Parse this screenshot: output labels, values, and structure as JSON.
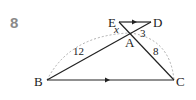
{
  "problem_number": "8",
  "points": {
    "E": {
      "label": "E",
      "x": 119,
      "y": 22
    },
    "D": {
      "label": "D",
      "x": 151,
      "y": 22
    },
    "A": {
      "label": "A",
      "x": 130,
      "y": 33
    },
    "B": {
      "label": "B",
      "x": 47,
      "y": 80
    },
    "C": {
      "label": "C",
      "x": 174,
      "y": 80
    }
  },
  "lengths": {
    "BA": "12",
    "AC": "8",
    "AD": "3",
    "EA": "x"
  },
  "colors": {
    "line": "#222222",
    "dashed": "#999999",
    "number": "#8a8a8a"
  }
}
